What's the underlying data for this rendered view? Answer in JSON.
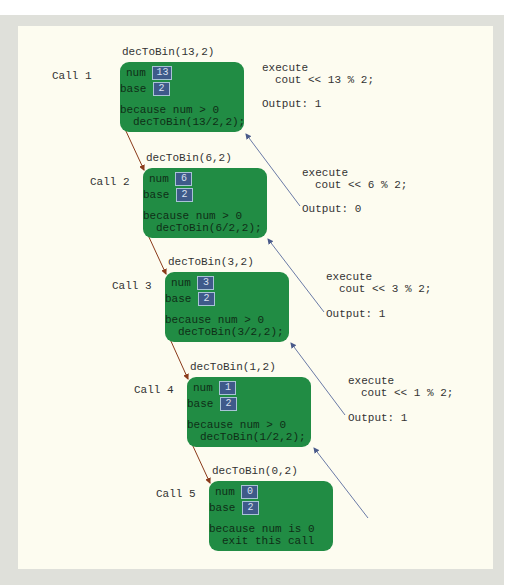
{
  "diagram": {
    "colors": {
      "box_fill": "#218c44",
      "value_fill": "#3f5a8a",
      "call_arrow": "#8a3a1a",
      "return_arrow": "#5a6a9a",
      "panel": "#fdfcf0",
      "frame": "#dfe0da"
    },
    "calls": [
      {
        "label": "Call 1",
        "invocation": "decToBin(13,2)",
        "num_label": "num",
        "num": "13",
        "base_label": "base",
        "base": "2",
        "reason_line1": "because num > 0",
        "reason_line2": "decToBin(13/2,2);",
        "execute_label": "execute",
        "execute_stmt": "cout << 13 % 2;",
        "output": "Output: 1"
      },
      {
        "label": "Call 2",
        "invocation": "decToBin(6,2)",
        "num_label": "num",
        "num": "6",
        "base_label": "base",
        "base": "2",
        "reason_line1": "because num > 0",
        "reason_line2": "decToBin(6/2,2);",
        "execute_label": "execute",
        "execute_stmt": "cout << 6 % 2;",
        "output": "Output: 0"
      },
      {
        "label": "Call 3",
        "invocation": "decToBin(3,2)",
        "num_label": "num",
        "num": "3",
        "base_label": "base",
        "base": "2",
        "reason_line1": "because num > 0",
        "reason_line2": "decToBin(3/2,2);",
        "execute_label": "execute",
        "execute_stmt": "cout << 3 % 2;",
        "output": "Output: 1"
      },
      {
        "label": "Call 4",
        "invocation": "decToBin(1,2)",
        "num_label": "num",
        "num": "1",
        "base_label": "base",
        "base": "2",
        "reason_line1": "because num > 0",
        "reason_line2": "decToBin(1/2,2);",
        "execute_label": "execute",
        "execute_stmt": "cout << 1 % 2;",
        "output": "Output: 1"
      },
      {
        "label": "Call 5",
        "invocation": "decToBin(0,2)",
        "num_label": "num",
        "num": "0",
        "base_label": "base",
        "base": "2",
        "reason_line1": "because num is 0",
        "reason_line2": "exit this call"
      }
    ]
  }
}
